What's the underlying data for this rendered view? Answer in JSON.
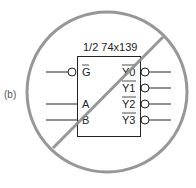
{
  "figure_label": "(b)",
  "chip": {
    "title": "1/2 74x139",
    "inputs": [
      {
        "label": "G",
        "active_low": true
      },
      {
        "label": "A",
        "active_low": false
      },
      {
        "label": "B",
        "active_low": false
      }
    ],
    "outputs": [
      {
        "label": "Y0",
        "active_low": true
      },
      {
        "label": "Y1",
        "active_low": true
      },
      {
        "label": "Y2",
        "active_low": true
      },
      {
        "label": "Y3",
        "active_low": true
      }
    ]
  },
  "overlay": {
    "symbol": "prohibition-sign",
    "color": "#8c8c8c"
  }
}
